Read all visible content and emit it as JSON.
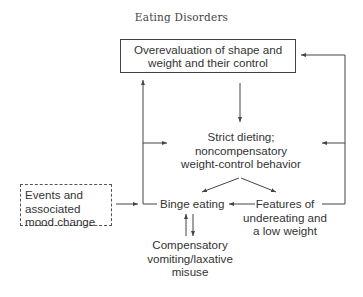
{
  "header": {
    "title": "Eating Disorders"
  },
  "diagram": {
    "nodes": {
      "overevaluation": {
        "lines": [
          "Overevaluation of shape and",
          "weight and their control"
        ],
        "style": "solid-box"
      },
      "strict_dieting": {
        "lines": [
          "Strict dieting;",
          "noncompensatory",
          "weight-control behavior"
        ],
        "style": "plain"
      },
      "events": {
        "lines": [
          "Events and",
          "associated",
          "mood change"
        ],
        "style": "dashed-box"
      },
      "binge_eating": {
        "lines": [
          "Binge eating"
        ],
        "style": "plain"
      },
      "features": {
        "lines": [
          "Features of",
          "undereating and",
          "a low weight"
        ],
        "style": "plain"
      },
      "compensatory": {
        "lines": [
          "Compensatory",
          "vomiting/laxative",
          "misuse"
        ],
        "style": "plain"
      }
    },
    "edges": [
      {
        "from": "overevaluation",
        "to": "strict_dieting"
      },
      {
        "from": "strict_dieting",
        "to": "binge_eating"
      },
      {
        "from": "strict_dieting",
        "to": "features"
      },
      {
        "from": "features",
        "to": "binge_eating"
      },
      {
        "from": "events",
        "to": "binge_eating"
      },
      {
        "from": "binge_eating",
        "to": "overevaluation"
      },
      {
        "from": "binge_eating",
        "to": "strict_dieting"
      },
      {
        "from": "features",
        "to": "overevaluation"
      },
      {
        "from": "features",
        "to": "strict_dieting"
      },
      {
        "from": "binge_eating",
        "to": "compensatory"
      },
      {
        "from": "compensatory",
        "to": "binge_eating"
      }
    ],
    "colors": {
      "line": "#444444",
      "text": "#333333"
    }
  }
}
